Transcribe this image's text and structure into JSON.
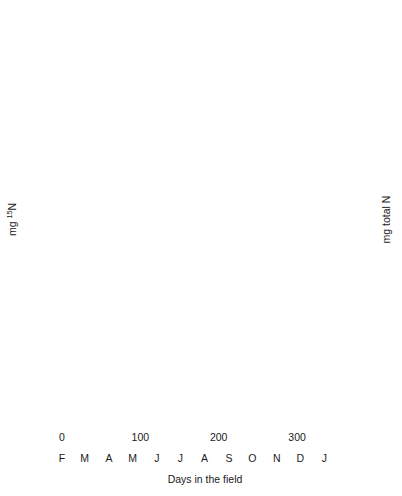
{
  "figure": {
    "page_header_fragment": "",
    "xlabel": "Days in the field",
    "ylabel_left_main": "mg",
    "ylabel_left_sup": "15",
    "ylabel_left_tail": "N",
    "ylabel_right": "mg total N"
  },
  "axes": {
    "left_ticks": [
      "0.0",
      "0.2",
      "0.4",
      "0.6",
      "0.8",
      "1.0"
    ],
    "left_values": [
      0.0,
      0.2,
      0.4,
      0.6,
      0.8,
      1.0
    ],
    "right_ticks": [
      "0",
      "10",
      "20",
      "30"
    ],
    "right_values": [
      0,
      10,
      20,
      30
    ],
    "right_minor_values": [
      5,
      15,
      25,
      35
    ],
    "x_ticks": [
      "0",
      "100",
      "200",
      "300"
    ],
    "x_values": [
      0,
      100,
      200,
      300
    ],
    "x_minor_values": [
      25,
      50,
      75,
      125,
      150,
      175,
      225,
      250,
      275,
      325,
      350
    ],
    "months": [
      "F",
      "M",
      "A",
      "M",
      "J",
      "J",
      "A",
      "S",
      "O",
      "N",
      "D",
      "J"
    ],
    "month_days": [
      0,
      29,
      60,
      90,
      121,
      151,
      182,
      213,
      243,
      274,
      304,
      335
    ],
    "xlim": [
      0,
      365
    ],
    "left_ylim": [
      0.0,
      1.0
    ],
    "right_ylim": [
      0,
      35
    ]
  },
  "chart_data": [
    {
      "type": "line",
      "panel": "(a)",
      "title": "",
      "xlabel": "Days in the field",
      "ylabel": "mg 15N",
      "ylabel_secondary": "mg total N",
      "xlim": [
        0,
        365
      ],
      "ylim": [
        0.0,
        1.0
      ],
      "ylim_secondary": [
        0,
        35
      ],
      "grid": false,
      "legend_position": "lower-left",
      "series": [
        {
          "name": "QP 15N",
          "style": "solid",
          "axis": "left",
          "x": [
            0,
            20,
            40,
            60,
            80,
            100,
            130,
            160,
            190,
            220,
            270,
            310,
            360
          ],
          "values": [
            1.0,
            0.79,
            0.63,
            0.52,
            0.44,
            0.4,
            0.39,
            0.37,
            0.34,
            0.33,
            0.37,
            0.28,
            0.17
          ]
        },
        {
          "name": "QP total N",
          "style": "dashed",
          "axis": "right",
          "x": [
            0,
            20,
            40,
            60,
            80,
            100,
            115,
            130,
            150,
            170,
            190,
            220,
            245,
            270,
            300,
            330,
            360
          ],
          "values": [
            16.5,
            17.5,
            18.8,
            19.3,
            19.0,
            17.0,
            20.5,
            22.5,
            21.5,
            20.5,
            21.0,
            23.5,
            26.0,
            30.5,
            28.0,
            25.0,
            23.0
          ],
          "values_left_scale": [
            0.47,
            0.5,
            0.54,
            0.55,
            0.54,
            0.49,
            0.59,
            0.64,
            0.61,
            0.59,
            0.6,
            0.67,
            0.74,
            0.87,
            0.8,
            0.71,
            0.66
          ]
        }
      ]
    },
    {
      "type": "line",
      "panel": "(b)",
      "title": "",
      "xlabel": "Days in the field",
      "ylabel": "mg 15N",
      "ylabel_secondary": "mg total N",
      "xlim": [
        0,
        365
      ],
      "ylim": [
        0.0,
        1.0
      ],
      "ylim_secondary": [
        0,
        35
      ],
      "grid": false,
      "legend_position": "lower-left",
      "series": [
        {
          "name": "CF 15N",
          "style": "solid",
          "axis": "left",
          "x": [
            0,
            45,
            75,
            100,
            120,
            135,
            160,
            190,
            225,
            270,
            310,
            360
          ],
          "values": [
            1.0,
            0.62,
            0.62,
            0.47,
            0.41,
            0.51,
            0.44,
            0.37,
            0.29,
            0.17,
            0.19,
            0.21
          ]
        },
        {
          "name": "CF total N",
          "style": "dashed",
          "axis": "right",
          "x": [
            0,
            25,
            50,
            75,
            100,
            120,
            135,
            160,
            190,
            225,
            270,
            310,
            360
          ],
          "values": [
            13.8,
            14.5,
            15.3,
            14.8,
            15.0,
            15.0,
            16.5,
            15.8,
            14.6,
            13.3,
            11.8,
            12.8,
            14.3
          ],
          "values_left_scale": [
            0.395,
            0.415,
            0.437,
            0.423,
            0.428,
            0.428,
            0.471,
            0.451,
            0.417,
            0.38,
            0.337,
            0.366,
            0.409
          ]
        }
      ]
    }
  ],
  "legends": {
    "panel_a": [
      {
        "label_main": "QP ",
        "label_sup": "15",
        "label_tail": "N",
        "style": "solid"
      },
      {
        "label_main": "QP total N",
        "label_sup": "",
        "label_tail": "",
        "style": "dashed"
      }
    ],
    "panel_b": [
      {
        "label_main": "CF ",
        "label_sup": "15",
        "label_tail": "N",
        "style": "solid"
      },
      {
        "label_main": "CF total N",
        "label_sup": "",
        "label_tail": "",
        "style": "dashed"
      }
    ]
  },
  "panels": {
    "a_label": "(a)",
    "b_label": "(b)"
  },
  "colors": {
    "ink": "#1a1a1a",
    "background": "#ffffff"
  }
}
